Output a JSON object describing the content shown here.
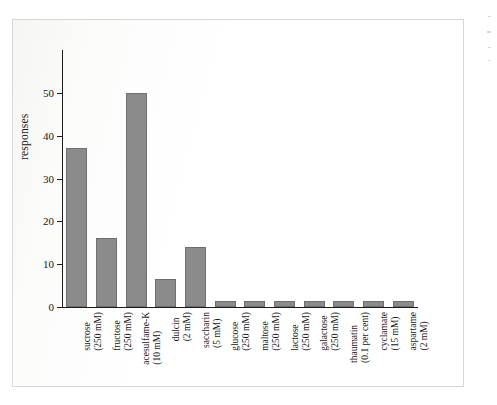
{
  "figure": {
    "y_axis_title": "responses",
    "y_ticks": [
      "0",
      "10",
      "20",
      "30",
      "40",
      "50"
    ],
    "bar_color": "#8b8b8b",
    "bar_edge_color": "#6f6f6f",
    "axis_color": "#1d1d1d",
    "page_background": "#ffffff"
  },
  "chart_data": {
    "type": "bar",
    "title": "",
    "xlabel": "",
    "ylabel": "responses",
    "ylim": [
      0,
      60
    ],
    "yticks": [
      0,
      10,
      20,
      30,
      40,
      50
    ],
    "grid": false,
    "legend": "none",
    "categories": [
      "sucrose (250 mM)",
      "fructose (250 mM)",
      "acesulfame-K (10 mM)",
      "dulcin (2 mM)",
      "saccharin (5 mM)",
      "glucose (250 mM)",
      "maltose (250 mM)",
      "lactose (250 mM)",
      "galactose (250 mM)",
      "thaumatin (0.1 per cent)",
      "cyclamate (15 mM)",
      "aspartame (2 mM)"
    ],
    "category_lines": [
      {
        "name": "sucrose",
        "dose": "(250 mM)"
      },
      {
        "name": "fructose",
        "dose": "(250 mM)"
      },
      {
        "name": "acesulfame-K",
        "dose": "(10 mM)"
      },
      {
        "name": "dulcin",
        "dose": "(2 mM)"
      },
      {
        "name": "saccharin",
        "dose": "(5 mM)"
      },
      {
        "name": "glucose",
        "dose": "(250 mM)"
      },
      {
        "name": "maltose",
        "dose": "(250 mM)"
      },
      {
        "name": "lactose",
        "dose": "(250 mM)"
      },
      {
        "name": "galactose",
        "dose": "(250 mM)"
      },
      {
        "name": "thaumatin",
        "dose": "(0.1 per cent)"
      },
      {
        "name": "cyclamate",
        "dose": "(15 mM)"
      },
      {
        "name": "aspartame",
        "dose": "(2 mM)"
      }
    ],
    "values": [
      37.2,
      16.2,
      50,
      6.6,
      14,
      1.5,
      1.5,
      1.5,
      1.5,
      1.5,
      1.5,
      1.5
    ]
  }
}
